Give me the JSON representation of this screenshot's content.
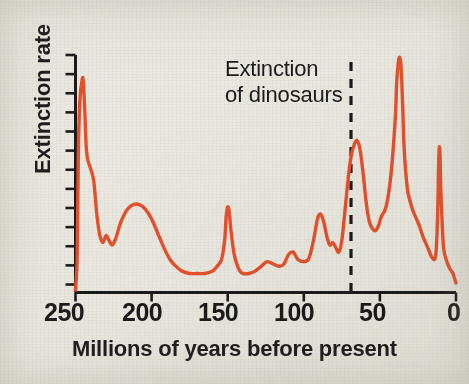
{
  "figure": {
    "background_color": "#eae8e0",
    "line_color": "#e8502b",
    "axis_color": "#1b1b1b"
  },
  "annotation": {
    "line1": "Extinction",
    "line2": "of dinosaurs",
    "marker_value_ma": 65,
    "marker_style": "dashed-vertical"
  },
  "axes": {
    "x_title": "Millions of years before present",
    "y_title": "Extinction rate",
    "x_ticks": [
      "250",
      "200",
      "150",
      "100",
      "50",
      "0"
    ],
    "y_tick_count": 13
  },
  "chart_data": {
    "type": "line",
    "title": "",
    "xlabel": "Millions of years before present",
    "ylabel": "Extinction rate",
    "xlim": [
      250,
      0
    ],
    "ylim": [
      0,
      100
    ],
    "x_reversed": true,
    "grid": false,
    "legend": null,
    "annotations": [
      {
        "text": "Extinction of dinosaurs",
        "x": 65,
        "style": "dashed vertical line with two-line text label"
      }
    ],
    "x_ticks": [
      250,
      200,
      150,
      100,
      50,
      0
    ],
    "y_ticks_labeled": false,
    "series": [
      {
        "name": "Extinction rate",
        "color": "#e8502b",
        "x": [
          250,
          249,
          248.5,
          248,
          247,
          246,
          245,
          244,
          243,
          242,
          240,
          238,
          236,
          234,
          232,
          230,
          228,
          226,
          224,
          222,
          220,
          216,
          212,
          208,
          204,
          200,
          196,
          192,
          188,
          184,
          180,
          175,
          170,
          165,
          160,
          157,
          154,
          152,
          151,
          150,
          149,
          148,
          146,
          144,
          142,
          140,
          136,
          132,
          128,
          124,
          120,
          116,
          113,
          110,
          107,
          104,
          100,
          97,
          95,
          93,
          91,
          89,
          87,
          85,
          83,
          81,
          79,
          77,
          75,
          73,
          71,
          69,
          67,
          65,
          63,
          61,
          59,
          57,
          55,
          53,
          51,
          49,
          46,
          43,
          40,
          39,
          38,
          37,
          36,
          35,
          34,
          32,
          30,
          28,
          26,
          24,
          22,
          20,
          18,
          16,
          14,
          13,
          12,
          11.5,
          11,
          10.5,
          10,
          9,
          8,
          6,
          4,
          2,
          1,
          0
        ],
        "y": [
          1,
          12,
          38,
          64,
          82,
          88,
          90,
          78,
          62,
          56,
          52,
          47,
          33,
          24,
          21,
          24,
          22,
          20,
          22,
          26,
          30,
          35,
          37,
          37,
          35,
          31,
          25,
          19,
          14,
          11,
          9,
          8,
          8,
          8,
          9,
          11,
          14,
          22,
          32,
          36,
          34,
          27,
          17,
          12,
          9,
          8,
          8,
          9,
          11,
          13,
          12,
          11,
          12,
          16,
          17,
          14,
          13,
          14,
          18,
          24,
          31,
          33,
          30,
          24,
          20,
          21,
          19,
          17,
          22,
          34,
          47,
          57,
          62,
          64,
          60,
          50,
          38,
          30,
          27,
          26,
          28,
          32,
          36,
          48,
          72,
          88,
          96,
          99,
          94,
          78,
          60,
          44,
          38,
          34,
          31,
          28,
          24,
          21,
          18,
          15,
          14,
          18,
          34,
          52,
          61,
          58,
          44,
          28,
          18,
          13,
          10,
          8,
          6,
          4
        ]
      }
    ]
  }
}
